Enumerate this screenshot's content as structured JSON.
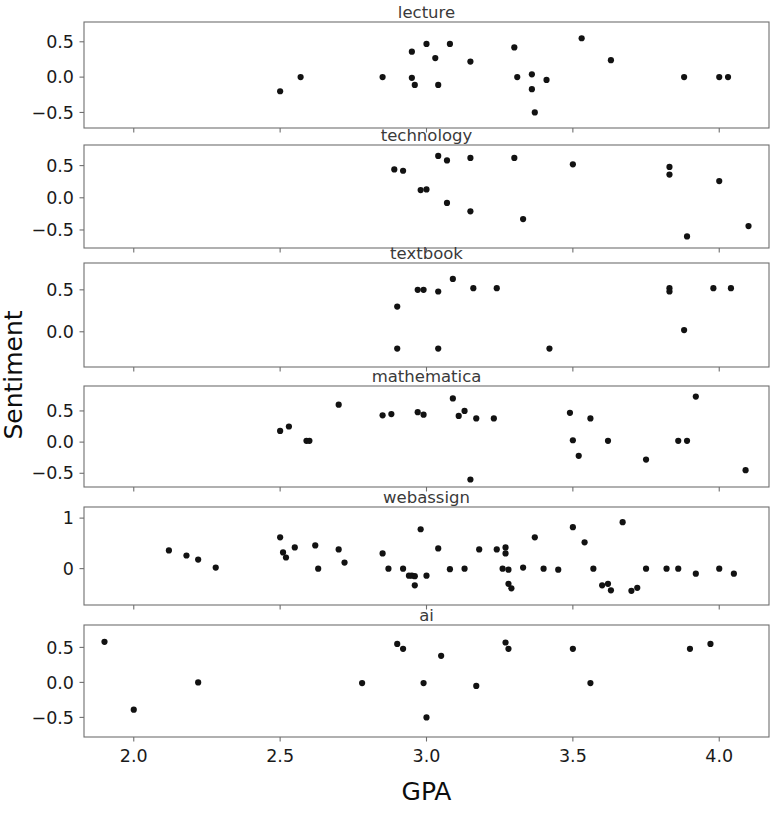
{
  "figure": {
    "xlabel": "GPA",
    "ylabel": "Sentiment",
    "background": "#ffffff",
    "marker_color": "#121212",
    "frame_color": "#6f6f6f"
  },
  "chart_data": {
    "type": "scatter",
    "title": "",
    "xlabel": "GPA",
    "ylabel": "Sentiment",
    "xlim": [
      1.83,
      4.17
    ],
    "xticks": [
      2.0,
      2.5,
      3.0,
      3.5,
      4.0
    ],
    "xticklabels": [
      "2.0",
      "2.5",
      "3.0",
      "3.5",
      "4.0"
    ],
    "grid": false,
    "legend": null,
    "layout": "6 stacked subplot rows sharing one x axis",
    "panels": [
      {
        "title": "lecture",
        "ylim": [
          -0.72,
          0.78
        ],
        "yticks": [
          0.5,
          0.0,
          -0.5
        ],
        "yticklabels": [
          "0.5",
          "0.0",
          "-0.5"
        ],
        "points": [
          [
            2.5,
            -0.2
          ],
          [
            2.57,
            0.0
          ],
          [
            2.85,
            0.0
          ],
          [
            2.95,
            0.36
          ],
          [
            2.95,
            -0.01
          ],
          [
            2.96,
            -0.11
          ],
          [
            3.0,
            0.47
          ],
          [
            3.03,
            0.27
          ],
          [
            3.04,
            -0.11
          ],
          [
            3.08,
            0.47
          ],
          [
            3.15,
            0.22
          ],
          [
            3.3,
            0.42
          ],
          [
            3.31,
            0.0
          ],
          [
            3.36,
            0.04
          ],
          [
            3.36,
            -0.17
          ],
          [
            3.37,
            -0.5
          ],
          [
            3.41,
            -0.04
          ],
          [
            3.53,
            0.55
          ],
          [
            3.63,
            0.24
          ],
          [
            3.88,
            0.0
          ],
          [
            4.0,
            0.0
          ],
          [
            4.03,
            0.0
          ]
        ]
      },
      {
        "title": "technology",
        "ylim": [
          -0.78,
          0.82
        ],
        "yticks": [
          0.5,
          0.0,
          -0.5
        ],
        "yticklabels": [
          "0.5",
          "0.0",
          "-0.5"
        ],
        "points": [
          [
            2.89,
            0.44
          ],
          [
            2.92,
            0.42
          ],
          [
            2.98,
            0.12
          ],
          [
            3.0,
            0.13
          ],
          [
            3.04,
            0.65
          ],
          [
            3.07,
            0.58
          ],
          [
            3.07,
            -0.08
          ],
          [
            3.15,
            0.62
          ],
          [
            3.15,
            -0.21
          ],
          [
            3.3,
            0.62
          ],
          [
            3.33,
            -0.33
          ],
          [
            3.5,
            0.52
          ],
          [
            3.83,
            0.48
          ],
          [
            3.83,
            0.36
          ],
          [
            3.89,
            -0.6
          ],
          [
            4.0,
            0.26
          ],
          [
            4.1,
            -0.44
          ]
        ]
      },
      {
        "title": "textbook",
        "ylim": [
          -0.42,
          0.82
        ],
        "yticks": [
          0.5,
          0.0
        ],
        "yticklabels": [
          "0.5",
          "0.0"
        ],
        "points": [
          [
            2.9,
            0.3
          ],
          [
            2.9,
            -0.2
          ],
          [
            2.97,
            0.5
          ],
          [
            2.99,
            0.5
          ],
          [
            3.04,
            0.48
          ],
          [
            3.04,
            -0.2
          ],
          [
            3.09,
            0.63
          ],
          [
            3.16,
            0.52
          ],
          [
            3.24,
            0.52
          ],
          [
            3.42,
            -0.2
          ],
          [
            3.83,
            0.52
          ],
          [
            3.83,
            0.48
          ],
          [
            3.88,
            0.02
          ],
          [
            3.98,
            0.52
          ],
          [
            4.04,
            0.52
          ]
        ]
      },
      {
        "title": "mathematica",
        "ylim": [
          -0.72,
          0.9
        ],
        "yticks": [
          0.5,
          0.0,
          -0.5
        ],
        "yticklabels": [
          "0.5",
          "0.0",
          "-0.5"
        ],
        "points": [
          [
            2.5,
            0.18
          ],
          [
            2.53,
            0.25
          ],
          [
            2.59,
            0.02
          ],
          [
            2.6,
            0.02
          ],
          [
            2.7,
            0.6
          ],
          [
            2.85,
            0.43
          ],
          [
            2.88,
            0.45
          ],
          [
            2.97,
            0.48
          ],
          [
            2.99,
            0.44
          ],
          [
            3.09,
            0.7
          ],
          [
            3.11,
            0.42
          ],
          [
            3.13,
            0.5
          ],
          [
            3.15,
            -0.6
          ],
          [
            3.17,
            0.38
          ],
          [
            3.23,
            0.38
          ],
          [
            3.49,
            0.47
          ],
          [
            3.5,
            0.03
          ],
          [
            3.52,
            -0.22
          ],
          [
            3.56,
            0.38
          ],
          [
            3.62,
            0.02
          ],
          [
            3.75,
            -0.28
          ],
          [
            3.86,
            0.02
          ],
          [
            3.89,
            0.02
          ],
          [
            3.92,
            0.73
          ],
          [
            4.09,
            -0.45
          ]
        ]
      },
      {
        "title": "webassign",
        "ylim": [
          -0.72,
          1.22
        ],
        "yticks": [
          1,
          0
        ],
        "yticklabels": [
          "1",
          "0"
        ],
        "points": [
          [
            2.12,
            0.36
          ],
          [
            2.18,
            0.26
          ],
          [
            2.22,
            0.18
          ],
          [
            2.28,
            0.02
          ],
          [
            2.5,
            0.62
          ],
          [
            2.51,
            0.32
          ],
          [
            2.52,
            0.22
          ],
          [
            2.55,
            0.42
          ],
          [
            2.62,
            0.46
          ],
          [
            2.63,
            0.0
          ],
          [
            2.7,
            0.38
          ],
          [
            2.72,
            0.12
          ],
          [
            2.85,
            0.3
          ],
          [
            2.87,
            0.0
          ],
          [
            2.92,
            0.0
          ],
          [
            2.94,
            -0.14
          ],
          [
            2.95,
            -0.14
          ],
          [
            2.96,
            -0.15
          ],
          [
            2.96,
            -0.33
          ],
          [
            2.98,
            0.78
          ],
          [
            3.0,
            -0.14
          ],
          [
            3.04,
            0.4
          ],
          [
            3.08,
            -0.01
          ],
          [
            3.13,
            0.0
          ],
          [
            3.18,
            0.38
          ],
          [
            3.24,
            0.38
          ],
          [
            3.26,
            0.0
          ],
          [
            3.27,
            0.42
          ],
          [
            3.27,
            0.3
          ],
          [
            3.28,
            -0.02
          ],
          [
            3.28,
            -0.3
          ],
          [
            3.29,
            -0.39
          ],
          [
            3.33,
            0.02
          ],
          [
            3.37,
            0.62
          ],
          [
            3.4,
            0.0
          ],
          [
            3.45,
            -0.02
          ],
          [
            3.5,
            0.82
          ],
          [
            3.54,
            0.52
          ],
          [
            3.57,
            0.0
          ],
          [
            3.6,
            -0.33
          ],
          [
            3.62,
            -0.3
          ],
          [
            3.63,
            -0.43
          ],
          [
            3.67,
            0.92
          ],
          [
            3.7,
            -0.44
          ],
          [
            3.72,
            -0.38
          ],
          [
            3.75,
            0.0
          ],
          [
            3.82,
            0.0
          ],
          [
            3.86,
            0.0
          ],
          [
            3.92,
            -0.1
          ],
          [
            4.0,
            0.0
          ],
          [
            4.05,
            -0.1
          ]
        ]
      },
      {
        "title": "ai",
        "ylim": [
          -0.78,
          0.82
        ],
        "yticks": [
          0.5,
          0.0,
          -0.5
        ],
        "yticklabels": [
          "0.5",
          "0.0",
          "-0.5"
        ],
        "points": [
          [
            1.9,
            0.58
          ],
          [
            2.0,
            -0.39
          ],
          [
            2.22,
            0.0
          ],
          [
            2.78,
            -0.01
          ],
          [
            2.9,
            0.55
          ],
          [
            2.92,
            0.48
          ],
          [
            2.99,
            -0.01
          ],
          [
            3.0,
            -0.5
          ],
          [
            3.05,
            0.38
          ],
          [
            3.17,
            -0.05
          ],
          [
            3.27,
            0.57
          ],
          [
            3.28,
            0.48
          ],
          [
            3.5,
            0.48
          ],
          [
            3.56,
            -0.01
          ],
          [
            3.9,
            0.48
          ],
          [
            3.97,
            0.55
          ]
        ]
      }
    ]
  }
}
